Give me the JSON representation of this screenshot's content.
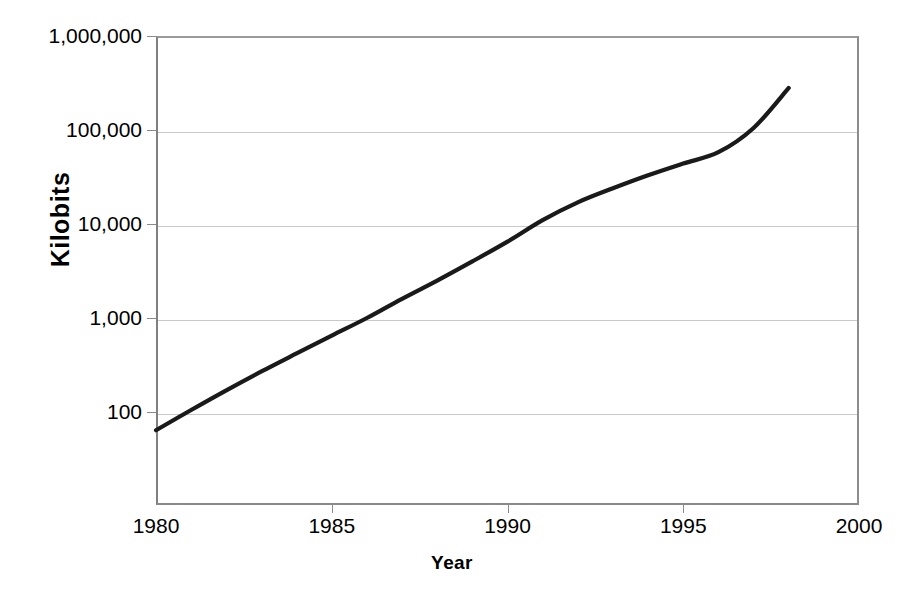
{
  "chart_data": {
    "type": "line",
    "title": "",
    "xlabel": "Year",
    "ylabel": "Kilobits",
    "yscale": "log",
    "xlim": [
      1980,
      2000
    ],
    "ylim": [
      10,
      1000000
    ],
    "grid": true,
    "legend": "none",
    "y_ticks": [
      {
        "value": 1000000,
        "label": "1,000,000"
      },
      {
        "value": 100000,
        "label": "100,000"
      },
      {
        "value": 10000,
        "label": "10,000"
      },
      {
        "value": 1000,
        "label": "1,000"
      },
      {
        "value": 100,
        "label": "100"
      }
    ],
    "x_ticks": [
      {
        "value": 1980,
        "label": "1980"
      },
      {
        "value": 1985,
        "label": "1985"
      },
      {
        "value": 1990,
        "label": "1990"
      },
      {
        "value": 1995,
        "label": "1995"
      },
      {
        "value": 2000,
        "label": "2000"
      }
    ],
    "series": [
      {
        "name": "Kilobits",
        "color": "#1a1a1a",
        "x": [
          1980,
          1981,
          1982,
          1983,
          1984,
          1985,
          1986,
          1987,
          1988,
          1989,
          1990,
          1991,
          1992,
          1993,
          1994,
          1995,
          1996,
          1997,
          1998
        ],
        "values": [
          64,
          105,
          170,
          270,
          420,
          650,
          1000,
          1600,
          2500,
          4000,
          6500,
          11000,
          17000,
          24000,
          33000,
          44000,
          58000,
          105000,
          280000
        ]
      }
    ],
    "annotations": []
  },
  "axes": {
    "y_title": "Kilobits",
    "x_title": "Year"
  },
  "colors": {
    "line": "#1a1a1a",
    "grid": "#c9c9c9",
    "frame": "#8a8a8a",
    "background": "#ffffff"
  }
}
